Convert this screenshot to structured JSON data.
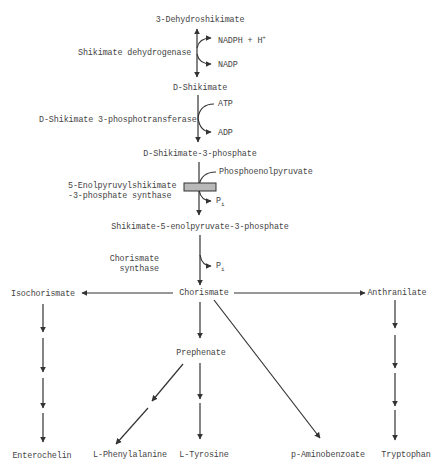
{
  "diagram": {
    "compounds": {
      "dehydroshikimate": "3-Dehydroshikimate",
      "shikimate": "D-Shikimate",
      "shikimate3p": "D-Shikimate-3-phosphate",
      "epsp": "Shikimate-5-enolpyruvate-3-phosphate",
      "chorismate": "Chorismate",
      "isochorismate": "Isochorismate",
      "anthranilate": "Anthranilate",
      "prephenate": "Prephenate",
      "enterochelin": "Enterochelin",
      "phenylalanine": "L-Phenylalanine",
      "tyrosine": "L-Tyrosine",
      "paba": "p-Aminobenzoate",
      "tryptophan": "Tryptophan"
    },
    "enzymes": {
      "e1": "Shikimate dehydrogenase",
      "e2": "D-Shikimate 3-phosphotransferase",
      "e3_line1": "5-Enolpyruvylshikimate",
      "e3_line2": "-3-phosphate synthase",
      "e4_line1": "Chorismate",
      "e4_line2": "synthase"
    },
    "cofactors": {
      "nadph": "NADPH + H",
      "nadph_sup": "+",
      "nadp": "NADP",
      "atp": "ATP",
      "adp": "ADP",
      "pep": "Phosphoenolpyruvate",
      "pi1": "P",
      "pi1_sub": "i",
      "pi2": "P",
      "pi2_sub": "i"
    },
    "colors": {
      "line": "#333333",
      "inhibitor_box": "#b8b8b8",
      "text": "#444444"
    }
  }
}
